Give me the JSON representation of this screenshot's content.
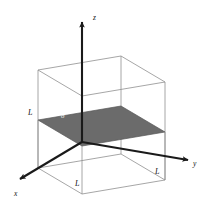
{
  "figure": {
    "kind": "3d-cube-diagram",
    "caption_text": "",
    "background_color": "#ffffff",
    "cube": {
      "edge_color": "#8c8c8c",
      "edge_width": 0.8,
      "face_fill": "none",
      "side_length_label": "L"
    },
    "plane": {
      "name": "cross-section-plane",
      "fill_color": "#6b6b6b",
      "stroke_color": "#4a4a4a",
      "label": "σ"
    },
    "axes": {
      "color": "#1a1a1a",
      "width": 2.1,
      "items": [
        {
          "id": "z",
          "label": "z",
          "direction": "up"
        },
        {
          "id": "y",
          "label": "y",
          "direction": "right"
        },
        {
          "id": "x",
          "label": "x",
          "direction": "down-left"
        }
      ]
    },
    "labels": {
      "z_axis": "z",
      "y_axis": "y",
      "x_axis": "x",
      "length_left": "L",
      "length_front": "L",
      "length_right": "L",
      "plane_sigma": "σ"
    }
  }
}
